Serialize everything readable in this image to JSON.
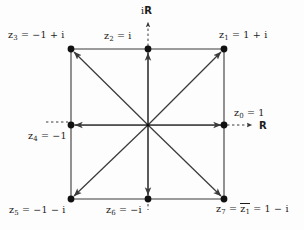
{
  "figure": {
    "background_color": "#fdfdfd",
    "line_color": "#3a3a3a",
    "dot_color": "#111111",
    "axes": {
      "imaginary_label": "i",
      "imaginary_blackboard": "R",
      "real_blackboard": "R"
    },
    "geometry": {
      "center": [
        148,
        125
      ],
      "left": 71,
      "right": 224,
      "top": 49,
      "bottom": 199
    },
    "points": [
      {
        "id": "z0",
        "label_plain": "z0 = 1",
        "name": "z",
        "sub": "0",
        "expr": "= 1",
        "x": 224,
        "y": 125
      },
      {
        "id": "z1",
        "label_plain": "z1 = 1 + i",
        "name": "z",
        "sub": "1",
        "expr": "= 1 + i",
        "x": 224,
        "y": 49
      },
      {
        "id": "z2",
        "label_plain": "z2 = i",
        "name": "z",
        "sub": "2",
        "expr": "= i",
        "x": 148,
        "y": 49
      },
      {
        "id": "z3",
        "label_plain": "z3 = -1 + i",
        "name": "z",
        "sub": "3",
        "expr": "= −1 + i",
        "x": 71,
        "y": 49
      },
      {
        "id": "z4",
        "label_plain": "z4 = -1",
        "name": "z",
        "sub": "4",
        "expr": "= −1",
        "x": 71,
        "y": 125
      },
      {
        "id": "z5",
        "label_plain": "z5 = -1 - i",
        "name": "z",
        "sub": "5",
        "expr": "= −1 − i",
        "x": 71,
        "y": 199
      },
      {
        "id": "z6",
        "label_plain": "z6 = -i",
        "name": "z",
        "sub": "6",
        "expr": "= −i",
        "x": 148,
        "y": 199
      },
      {
        "id": "z7",
        "label_plain": "z7 = conj(z1) = 1 - i",
        "name": "z",
        "sub": "7",
        "expr": "= 1 − i",
        "x": 224,
        "y": 199
      }
    ],
    "labels": {
      "z3": {
        "pre": "z",
        "sub": "3",
        "post": " = −1 + i"
      },
      "z2": {
        "pre": "z",
        "sub": "2",
        "post": " = i"
      },
      "z1": {
        "pre": "z",
        "sub": "1",
        "post": " = 1 + i"
      },
      "z0": {
        "pre": "z",
        "sub": "0",
        "post": " = 1"
      },
      "z4": {
        "pre": "z",
        "sub": "4",
        "post": " = −1"
      },
      "z5": {
        "pre": "z",
        "sub": "5",
        "post": " = −1 − i"
      },
      "z6": {
        "pre": "z",
        "sub": "6",
        "post": " = −i"
      },
      "z7": {
        "pre": "z",
        "sub": "7",
        "mid": " = ",
        "conj_name": "z",
        "conj_sub": "1",
        "post": " = 1 − i"
      },
      "real_axis": "R",
      "imag_axis_i": "i",
      "imag_axis_R": "R"
    }
  }
}
